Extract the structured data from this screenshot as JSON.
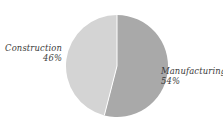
{
  "chart_data": {
    "type": "pie",
    "title": "",
    "subtitle": "",
    "xlabel": "",
    "ylabel": "",
    "legend_position": "none",
    "grid": false,
    "labels_inline": true,
    "total_percent": "100%",
    "categories": [
      "Manufacturing",
      "Construction"
    ],
    "values": [
      54,
      46
    ],
    "slices": [
      {
        "name": "Manufacturing",
        "value": 54,
        "value_label": "54%",
        "color": "#a9a9a9",
        "label_side": "right",
        "start_angle_deg": 0,
        "end_angle_deg": 194.4
      },
      {
        "name": "Construction",
        "value": 46,
        "value_label": "46%",
        "color": "#d4d4d4",
        "label_side": "left",
        "start_angle_deg": 194.4,
        "end_angle_deg": 360
      }
    ]
  },
  "figure": {
    "background_color": "#ffffff",
    "top_clipped_text": ". .  .      .     .      .",
    "pie": {
      "center_x": 52,
      "center_y": 52,
      "radius": 51,
      "stroke_color": "#ffffff"
    }
  },
  "labels": {
    "construction": {
      "name": "Construction",
      "percent": "46%"
    },
    "manufacturing": {
      "name": "Manufacturing",
      "percent": "54%"
    }
  }
}
